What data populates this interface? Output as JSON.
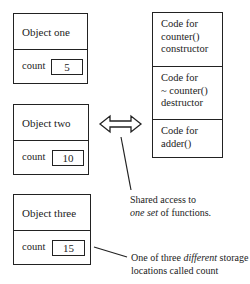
{
  "objects": [
    {
      "title": "Object one",
      "field_label": "count",
      "value": "5"
    },
    {
      "title": "Object two",
      "field_label": "count",
      "value": "10"
    },
    {
      "title": "Object three",
      "field_label": "count",
      "value": "15"
    }
  ],
  "code_blocks": [
    {
      "line1": "Code for",
      "line2": "counter()",
      "line3": "constructor"
    },
    {
      "line1": "Code for",
      "line2": "~ counter()",
      "line3": "destructor"
    },
    {
      "line1": "Code for",
      "line2": "adder()"
    }
  ],
  "annotations": {
    "shared": {
      "pre": "Shared access to",
      "italic": "one set",
      "post": " of functions."
    },
    "storage": {
      "pre": "One of three ",
      "italic": "different",
      "post": " storage",
      "line2": "locations called count"
    }
  },
  "arrow_icon": "double-headed-arrow"
}
